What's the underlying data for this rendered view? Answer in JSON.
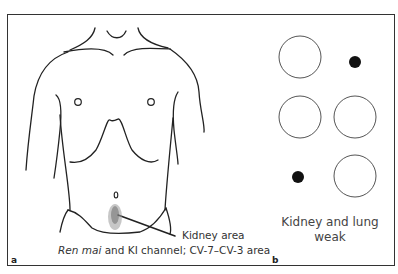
{
  "figure": {
    "panel_a": {
      "label": "a",
      "annotation_line1": "Kidney area",
      "annotation_line2_italic": "Ren mai",
      "annotation_line2_rest": " and KI channel; CV-7–CV-3 area"
    },
    "panel_b": {
      "label": "b",
      "caption_line1": "Kidney and lung",
      "caption_line2": "weak",
      "markers": [
        {
          "row": 1,
          "col": 1,
          "type": "open-circle"
        },
        {
          "row": 1,
          "col": 2,
          "type": "filled-dot"
        },
        {
          "row": 2,
          "col": 1,
          "type": "open-circle"
        },
        {
          "row": 2,
          "col": 2,
          "type": "open-circle"
        },
        {
          "row": 3,
          "col": 1,
          "type": "filled-dot"
        },
        {
          "row": 3,
          "col": 2,
          "type": "open-circle"
        }
      ]
    }
  }
}
